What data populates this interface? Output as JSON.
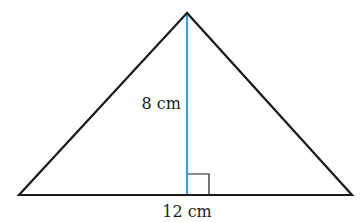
{
  "diagram": {
    "type": "triangle",
    "labels": {
      "height": "8 cm",
      "base": "12 cm"
    },
    "colors": {
      "outline": "#1a1a1a",
      "height_line": "#3a9ee0",
      "right_angle_marker": "#1a1a1a",
      "text": "#231f20"
    },
    "geometry": {
      "apex": [
        187,
        13
      ],
      "base_left": [
        19,
        195
      ],
      "base_right": [
        352,
        195
      ],
      "height_foot": [
        187,
        195
      ]
    }
  }
}
